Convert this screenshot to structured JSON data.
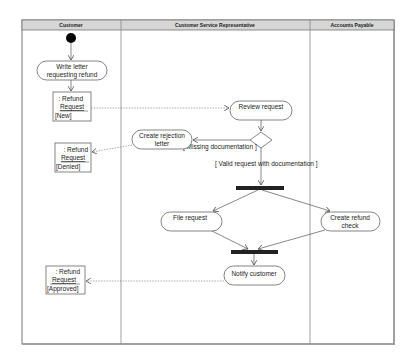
{
  "diagram": {
    "type": "UML activity diagram",
    "lanes": [
      {
        "name": "Customer"
      },
      {
        "name": "Customer Service Representative"
      },
      {
        "name": "Accounts Payable"
      }
    ],
    "actions": {
      "write_letter": [
        "Write letter",
        "requesting refund"
      ],
      "review_request": "Review request",
      "create_rejection": [
        "Create rejection",
        "letter"
      ],
      "file_request": "File request",
      "create_check": [
        "Create refund",
        "check"
      ],
      "notify_customer": "Notify customer"
    },
    "objects": {
      "new": {
        "line1": ": Refund",
        "line2": "Request",
        "state": "[New]"
      },
      "denied": {
        "line1": ": Refund",
        "line2": "Request",
        "state": "[Denied]"
      },
      "approved": {
        "line1": ": Refund",
        "line2": "Request",
        "state": "[Approved]"
      }
    },
    "guards": {
      "missing": "[ Missing documentation ]",
      "valid": "[ Valid request with documentation ]"
    }
  }
}
